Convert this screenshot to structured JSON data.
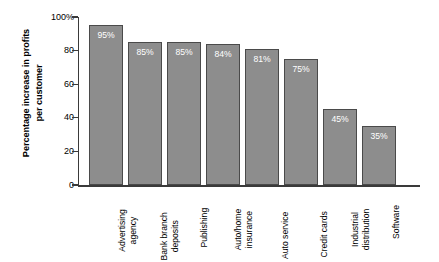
{
  "chart_data": {
    "type": "bar",
    "title": "",
    "subtitle": "",
    "xlabel": "",
    "ylabel": "Percentage increase in profits per customer",
    "ylabel_lines": [
      "Percentage increase in profits",
      "per customer"
    ],
    "categories": [
      "Advertising agency",
      "Bank branch deposits",
      "Publishing",
      "Auto/home insurance",
      "Auto service",
      "Credit cards",
      "Industrial distribution",
      "Software"
    ],
    "category_lines": [
      [
        "Advertising",
        "agency"
      ],
      [
        "Bank branch",
        "deposits"
      ],
      [
        "Publishing"
      ],
      [
        "Auto/home",
        "insurance"
      ],
      [
        "Auto service"
      ],
      [
        "Credit cards"
      ],
      [
        "Industrial",
        "distribution"
      ],
      [
        "Software"
      ]
    ],
    "values": [
      95,
      85,
      85,
      84,
      81,
      75,
      45,
      35
    ],
    "value_labels": [
      "95%",
      "85%",
      "85%",
      "84%",
      "81%",
      "75%",
      "45%",
      "35%"
    ],
    "ylim": [
      0,
      100
    ],
    "yticks": [
      0,
      20,
      40,
      60,
      80,
      100
    ],
    "ytick_labels": [
      "0",
      "20",
      "40",
      "60",
      "80",
      "100%"
    ],
    "grid": false,
    "legend": null,
    "bar_color": "#8d8d8d",
    "bar_border_color": "#4a4a4a",
    "value_label_color": "#ffffff",
    "axis_color": "#3a3a3a",
    "background": "#ffffff"
  }
}
